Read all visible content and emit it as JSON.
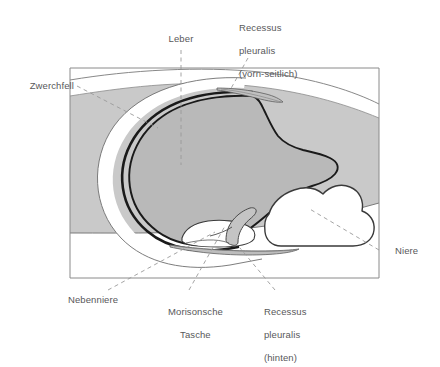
{
  "figure": {
    "kind": "anatomical-cross-section-diagram"
  },
  "colors": {
    "background": "#ffffff",
    "body_band_gray": "#c9c9c9",
    "organ_gray": "#b9b9b9",
    "organ_light_gray": "#d2d2d2",
    "outline_dark": "#1a1a1a",
    "outline_thin": "#6e6e6e",
    "frame_line": "#8a8a8a",
    "leader_line": "#9a9a9a",
    "text": "#58585a"
  },
  "labels": {
    "zwerchfell": {
      "text": "Zwerchfell",
      "lines": [
        "Zwerchfell"
      ]
    },
    "leber": {
      "text": "Leber",
      "lines": [
        "Leber"
      ]
    },
    "recessus_pleuralis_vorn": {
      "text": "Recessus pleuralis (vorn-seitlich)",
      "lines": [
        "Recessus",
        "pleuralis",
        "(vorn-seitlich)"
      ]
    },
    "niere": {
      "text": "Niere",
      "lines": [
        "Niere"
      ]
    },
    "nebenniere": {
      "text": "Nebenniere",
      "lines": [
        "Nebenniere"
      ]
    },
    "morisonsche_tasche": {
      "text": "Morisonsche Tasche",
      "lines": [
        "Morisonsche",
        "Tasche"
      ]
    },
    "recessus_pleuralis_hinten": {
      "text": "Recessus pleuralis (hinten)",
      "lines": [
        "Recessus",
        "pleuralis",
        "(hinten)"
      ]
    }
  },
  "structures": [
    {
      "name": "zwerchfell",
      "label": "Zwerchfell"
    },
    {
      "name": "leber",
      "label": "Leber"
    },
    {
      "name": "recessus-pleuralis-vorn-seitlich",
      "label": "Recessus pleuralis (vorn-seitlich)"
    },
    {
      "name": "niere",
      "label": "Niere"
    },
    {
      "name": "nebenniere",
      "label": "Nebenniere"
    },
    {
      "name": "morisonsche-tasche",
      "label": "Morisonsche Tasche"
    },
    {
      "name": "recessus-pleuralis-hinten",
      "label": "Recessus pleuralis (hinten)"
    }
  ]
}
